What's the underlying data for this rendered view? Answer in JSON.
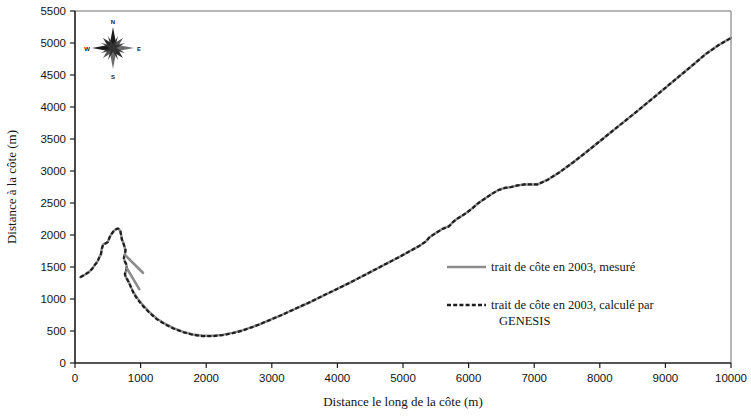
{
  "figure": {
    "name": "coastline-evolution-chart",
    "background": "#ffffff"
  },
  "chart_data": {
    "type": "line",
    "title": "",
    "xlabel": "Distance le long de la côte (m)",
    "ylabel": "Distance à la côte (m)",
    "xlim": [
      0,
      10000
    ],
    "ylim": [
      0,
      5500
    ],
    "xticks": [
      0,
      1000,
      2000,
      3000,
      4000,
      5000,
      6000,
      7000,
      8000,
      9000,
      10000
    ],
    "yticks": [
      0,
      500,
      1000,
      1500,
      2000,
      2500,
      3000,
      3500,
      4000,
      4500,
      5000,
      5500
    ],
    "xtick_labels": [
      "0",
      "1000",
      "2000",
      "3000",
      "4000",
      "5000",
      "6000",
      "7000",
      "8000",
      "9000",
      "10000"
    ],
    "ytick_labels": [
      "0",
      "500",
      "1000",
      "1500",
      "2000",
      "2500",
      "3000",
      "3500",
      "4000",
      "4500",
      "5000",
      "5500"
    ],
    "grid": false,
    "legend_position": "center-right",
    "series": [
      {
        "name": "trait de côte  en 2003, mesuré",
        "style": "solid",
        "color": "#8c8c8c",
        "points": [
          [
            80,
            1340
          ],
          [
            150,
            1380
          ],
          [
            210,
            1420
          ],
          [
            260,
            1470
          ],
          [
            300,
            1530
          ],
          [
            340,
            1580
          ],
          [
            370,
            1650
          ],
          [
            395,
            1700
          ],
          [
            410,
            1790
          ],
          [
            430,
            1855
          ],
          [
            470,
            1870
          ],
          [
            500,
            1890
          ],
          [
            530,
            1970
          ],
          [
            560,
            2020
          ],
          [
            600,
            2075
          ],
          [
            635,
            2095
          ],
          [
            660,
            2100
          ],
          [
            690,
            2065
          ],
          [
            705,
            1990
          ],
          [
            715,
            1930
          ],
          [
            735,
            1880
          ],
          [
            755,
            1815
          ],
          [
            770,
            1760
          ],
          [
            760,
            1700
          ],
          [
            745,
            1640
          ],
          [
            760,
            1585
          ],
          [
            780,
            1545
          ],
          [
            790,
            1480
          ],
          [
            775,
            1430
          ],
          [
            760,
            1390
          ],
          [
            775,
            1340
          ],
          [
            800,
            1300
          ],
          [
            830,
            1240
          ],
          [
            855,
            1180
          ],
          [
            900,
            1090
          ],
          [
            960,
            1000
          ],
          [
            1040,
            900
          ],
          [
            1130,
            800
          ],
          [
            1240,
            700
          ],
          [
            1370,
            615
          ],
          [
            1500,
            545
          ],
          [
            1650,
            485
          ],
          [
            1800,
            445
          ],
          [
            1950,
            425
          ],
          [
            2100,
            425
          ],
          [
            2250,
            440
          ],
          [
            2400,
            470
          ],
          [
            2550,
            510
          ],
          [
            2700,
            560
          ],
          [
            2850,
            620
          ],
          [
            3000,
            685
          ],
          [
            3150,
            750
          ],
          [
            3300,
            820
          ],
          [
            3450,
            890
          ],
          [
            3600,
            960
          ],
          [
            3750,
            1035
          ],
          [
            3900,
            1110
          ],
          [
            4050,
            1185
          ],
          [
            4200,
            1260
          ],
          [
            4350,
            1340
          ],
          [
            4500,
            1420
          ],
          [
            4650,
            1500
          ],
          [
            4800,
            1580
          ],
          [
            4950,
            1660
          ],
          [
            5100,
            1745
          ],
          [
            5250,
            1830
          ],
          [
            5350,
            1900
          ],
          [
            5400,
            1960
          ],
          [
            5500,
            2030
          ],
          [
            5600,
            2095
          ],
          [
            5700,
            2135
          ],
          [
            5760,
            2200
          ],
          [
            5820,
            2250
          ],
          [
            5900,
            2300
          ],
          [
            5980,
            2355
          ],
          [
            6060,
            2420
          ],
          [
            6150,
            2500
          ],
          [
            6250,
            2570
          ],
          [
            6350,
            2640
          ],
          [
            6450,
            2700
          ],
          [
            6550,
            2735
          ],
          [
            6650,
            2750
          ],
          [
            6750,
            2775
          ],
          [
            6850,
            2790
          ],
          [
            6950,
            2790
          ],
          [
            7050,
            2790
          ],
          [
            7200,
            2860
          ],
          [
            7400,
            2990
          ],
          [
            7600,
            3140
          ],
          [
            7800,
            3300
          ],
          [
            8000,
            3465
          ],
          [
            8200,
            3630
          ],
          [
            8400,
            3795
          ],
          [
            8600,
            3960
          ],
          [
            8800,
            4130
          ],
          [
            9000,
            4300
          ],
          [
            9200,
            4470
          ],
          [
            9400,
            4640
          ],
          [
            9600,
            4815
          ],
          [
            9800,
            4960
          ],
          [
            10000,
            5080
          ]
        ]
      },
      {
        "name": "trait de côte en 2003,  calculé par GENESIS",
        "style": "dashed",
        "color": "#1e1e1e",
        "points": [
          [
            80,
            1340
          ],
          [
            150,
            1380
          ],
          [
            210,
            1420
          ],
          [
            260,
            1470
          ],
          [
            300,
            1530
          ],
          [
            340,
            1580
          ],
          [
            370,
            1650
          ],
          [
            395,
            1700
          ],
          [
            410,
            1790
          ],
          [
            430,
            1855
          ],
          [
            470,
            1870
          ],
          [
            500,
            1890
          ],
          [
            530,
            1970
          ],
          [
            560,
            2020
          ],
          [
            600,
            2075
          ],
          [
            635,
            2095
          ],
          [
            660,
            2100
          ],
          [
            690,
            2065
          ],
          [
            705,
            1990
          ],
          [
            715,
            1930
          ],
          [
            735,
            1880
          ],
          [
            755,
            1815
          ],
          [
            770,
            1760
          ],
          [
            760,
            1700
          ],
          [
            745,
            1640
          ],
          [
            760,
            1585
          ],
          [
            780,
            1545
          ],
          [
            790,
            1480
          ],
          [
            775,
            1430
          ],
          [
            760,
            1390
          ],
          [
            775,
            1340
          ],
          [
            800,
            1300
          ],
          [
            830,
            1240
          ],
          [
            855,
            1180
          ],
          [
            900,
            1075
          ],
          [
            960,
            985
          ],
          [
            1040,
            885
          ],
          [
            1130,
            790
          ],
          [
            1240,
            690
          ],
          [
            1370,
            605
          ],
          [
            1500,
            540
          ],
          [
            1650,
            480
          ],
          [
            1800,
            440
          ],
          [
            1950,
            420
          ],
          [
            2100,
            420
          ],
          [
            2250,
            435
          ],
          [
            2400,
            465
          ],
          [
            2550,
            505
          ],
          [
            2700,
            560
          ],
          [
            2850,
            620
          ],
          [
            3000,
            685
          ],
          [
            3150,
            750
          ],
          [
            3300,
            820
          ],
          [
            3450,
            890
          ],
          [
            3600,
            960
          ],
          [
            3750,
            1035
          ],
          [
            3900,
            1110
          ],
          [
            4050,
            1185
          ],
          [
            4200,
            1260
          ],
          [
            4350,
            1340
          ],
          [
            4500,
            1420
          ],
          [
            4650,
            1500
          ],
          [
            4800,
            1580
          ],
          [
            4950,
            1660
          ],
          [
            5100,
            1745
          ],
          [
            5250,
            1830
          ],
          [
            5350,
            1900
          ],
          [
            5400,
            1960
          ],
          [
            5500,
            2030
          ],
          [
            5600,
            2095
          ],
          [
            5700,
            2135
          ],
          [
            5760,
            2200
          ],
          [
            5820,
            2250
          ],
          [
            5900,
            2300
          ],
          [
            5980,
            2355
          ],
          [
            6060,
            2420
          ],
          [
            6150,
            2500
          ],
          [
            6250,
            2570
          ],
          [
            6350,
            2640
          ],
          [
            6450,
            2700
          ],
          [
            6550,
            2735
          ],
          [
            6650,
            2750
          ],
          [
            6750,
            2775
          ],
          [
            6850,
            2790
          ],
          [
            6950,
            2790
          ],
          [
            7050,
            2790
          ],
          [
            7200,
            2860
          ],
          [
            7400,
            2990
          ],
          [
            7600,
            3140
          ],
          [
            7800,
            3300
          ],
          [
            8000,
            3465
          ],
          [
            8200,
            3630
          ],
          [
            8400,
            3795
          ],
          [
            8600,
            3960
          ],
          [
            8800,
            4130
          ],
          [
            9000,
            4300
          ],
          [
            9200,
            4470
          ],
          [
            9400,
            4640
          ],
          [
            9600,
            4815
          ],
          [
            9800,
            4960
          ],
          [
            10000,
            5080
          ]
        ]
      }
    ],
    "spurs": [
      {
        "name": "spur-upper",
        "points": [
          [
            760,
            1690
          ],
          [
            1035,
            1410
          ]
        ]
      },
      {
        "name": "spur-lower",
        "points": [
          [
            790,
            1480
          ],
          [
            980,
            1155
          ]
        ]
      }
    ]
  },
  "legend": {
    "name": "chart-legend",
    "entries": [
      {
        "label": "trait de côte  en 2003, mesuré",
        "style": "solid",
        "color": "#8c8c8c"
      },
      {
        "label": "trait de côte en 2003,  calculé par",
        "label2": "GENESIS",
        "style": "dashed",
        "color": "#1e1e1e"
      }
    ]
  },
  "compass": {
    "name": "compass-rose",
    "north": "N",
    "east": "E",
    "south": "S",
    "west": "W"
  }
}
